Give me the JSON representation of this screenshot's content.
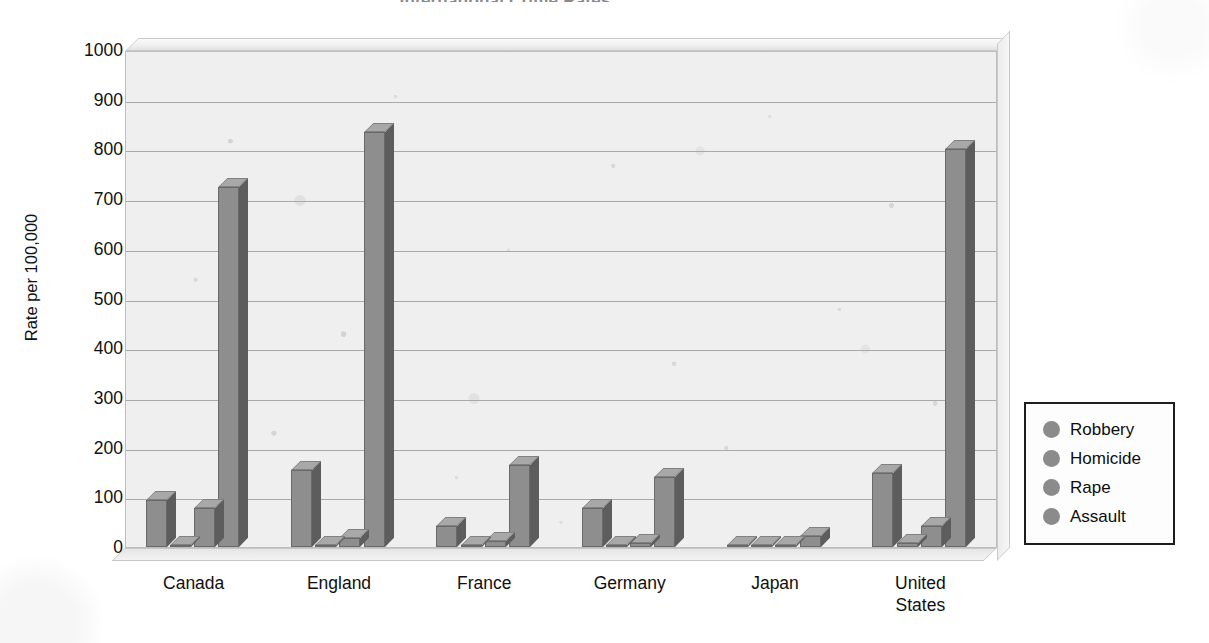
{
  "chart_data": {
    "type": "bar",
    "title": "International Crime Rates",
    "xlabel": "",
    "ylabel": "Rate per 100,000",
    "ylim": [
      0,
      1000
    ],
    "ytick_labels": [
      "1000",
      "900",
      "800",
      "700",
      "600",
      "500",
      "400",
      "300",
      "200",
      "100",
      "0"
    ],
    "grid": true,
    "legend_position": "right",
    "categories": [
      "Canada",
      "England",
      "France",
      "Germany",
      "Japan",
      "United States"
    ],
    "category_lines": [
      [
        "Canada"
      ],
      [
        "England"
      ],
      [
        "France"
      ],
      [
        "Germany"
      ],
      [
        "Japan"
      ],
      [
        "United",
        "States"
      ]
    ],
    "series": [
      {
        "name": "Robbery",
        "values": [
          95,
          155,
          42,
          78,
          4,
          148
        ]
      },
      {
        "name": "Homicide",
        "values": [
          2,
          2,
          2,
          3,
          1,
          9
        ]
      },
      {
        "name": "Rape",
        "values": [
          78,
          18,
          13,
          9,
          2,
          42
        ]
      },
      {
        "name": "Assault",
        "values": [
          725,
          835,
          165,
          140,
          22,
          800
        ]
      }
    ],
    "colors": {
      "bar_face": "#8e8e8e",
      "bar_side": "#5d5d5d",
      "bar_top": "#a8a8a8",
      "plot_background": "#efefef",
      "gridline": "#a9a9a9",
      "legend_swatch": "#8b8b8b",
      "text": "#0f0f0f"
    }
  },
  "legend": {
    "items": [
      {
        "label": "Robbery",
        "swatch": "legend-swatch-circle"
      },
      {
        "label": "Homicide",
        "swatch": "legend-swatch-circle"
      },
      {
        "label": "Rape",
        "swatch": "legend-swatch-circle"
      },
      {
        "label": "Assault",
        "swatch": "legend-swatch-circle"
      }
    ]
  }
}
